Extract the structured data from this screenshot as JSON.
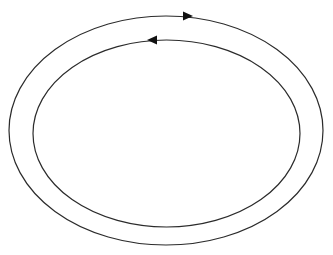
{
  "diagram": {
    "type": "concentric-loops",
    "stroke_color": "#2b2b2b",
    "background": "#ffffff",
    "loops": [
      {
        "id": "outer-loop",
        "cx": 166,
        "cy": 130.5,
        "rx": 157,
        "ry": 114.5,
        "direction": "clockwise",
        "arrow": {
          "x": 188,
          "y": 16,
          "points": "right"
        }
      },
      {
        "id": "inner-loop",
        "cx": 166.5,
        "cy": 133.5,
        "rx": 133.5,
        "ry": 93.5,
        "direction": "counter-clockwise",
        "arrow": {
          "x": 152,
          "y": 40,
          "points": "left"
        }
      }
    ]
  }
}
